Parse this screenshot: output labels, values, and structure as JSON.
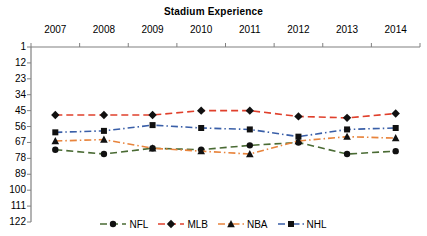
{
  "chart_data": {
    "type": "line",
    "title": "Stadium Experience",
    "xlabel": "",
    "ylabel": "",
    "grid": false,
    "legend_position": "bottom",
    "y_axis_inverted": true,
    "ylim": [
      1,
      122
    ],
    "yticks": [
      1,
      12,
      23,
      34,
      45,
      56,
      67,
      78,
      89,
      100,
      111,
      122
    ],
    "categories": [
      "2007",
      "2008",
      "2009",
      "2010",
      "2011",
      "2012",
      "2013",
      "2014"
    ],
    "series": [
      {
        "name": "NFL",
        "color": "#4a6b34",
        "marker": "circle",
        "dash": "dashed",
        "values": [
          72,
          75,
          71,
          72,
          69,
          67,
          75,
          73
        ]
      },
      {
        "name": "MLB",
        "color": "#e0402c",
        "marker": "diamond",
        "dash": "dashed",
        "values": [
          48,
          48,
          48,
          45,
          45,
          49,
          50,
          47
        ]
      },
      {
        "name": "NBA",
        "color": "#e8843c",
        "marker": "triangle",
        "dash": "dash-dot",
        "values": [
          66,
          65,
          71,
          73,
          75,
          66,
          63,
          64
        ]
      },
      {
        "name": "NHL",
        "color": "#3a5fa8",
        "marker": "square",
        "dash": "dash-dot",
        "values": [
          60,
          59,
          55,
          57,
          58,
          63,
          58,
          57
        ]
      }
    ]
  },
  "legend": {
    "items": [
      {
        "label": "NFL"
      },
      {
        "label": "MLB"
      },
      {
        "label": "NBA"
      },
      {
        "label": "NHL"
      }
    ]
  },
  "axis": {
    "color": "#808080"
  }
}
